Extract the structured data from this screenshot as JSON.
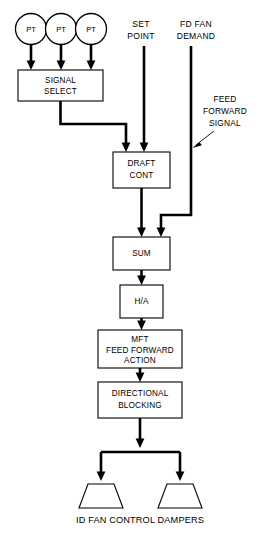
{
  "diagram": {
    "caption": "ID FAN CONTROL DAMPERS",
    "line_color": "#000000",
    "background_color": "#ffffff",
    "transmitters": [
      {
        "label": "PT",
        "name": "pt-1"
      },
      {
        "label": "PT",
        "name": "pt-2"
      },
      {
        "label": "PT",
        "name": "pt-3"
      }
    ],
    "sources": [
      {
        "name": "set-point",
        "line1": "SET",
        "line2": "POINT"
      },
      {
        "name": "fd-fan-demand",
        "line1": "FD FAN",
        "line2": "DEMAND"
      }
    ],
    "annotation": {
      "name": "feed-forward-signal",
      "line1": "FEED",
      "line2": "FORWARD",
      "line3": "SIGNAL"
    },
    "blocks": [
      {
        "name": "signal-select",
        "line1": "SIGNAL",
        "line2": "SELECT",
        "line3": ""
      },
      {
        "name": "draft-cont",
        "line1": "DRAFT",
        "line2": "CONT",
        "line3": ""
      },
      {
        "name": "sum",
        "line1": "SUM",
        "line2": "",
        "line3": ""
      },
      {
        "name": "hand-auto",
        "line1": "H/A",
        "line2": "",
        "line3": ""
      },
      {
        "name": "mft-feed-forward-action",
        "line1": "MFT",
        "line2": "FEED FORWARD",
        "line3": "ACTION"
      },
      {
        "name": "directional-blocking",
        "line1": "DIRECTIONAL",
        "line2": "BLOCKING",
        "line3": ""
      }
    ],
    "dampers": [
      {
        "name": "damper-left"
      },
      {
        "name": "damper-right"
      }
    ]
  }
}
